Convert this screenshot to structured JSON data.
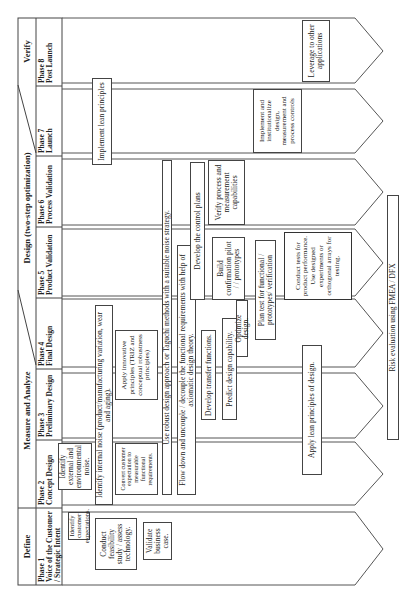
{
  "header": {
    "stages": [
      {
        "id": "define",
        "label": "Define"
      },
      {
        "id": "measure",
        "label": "Measure and Analyze"
      },
      {
        "id": "design",
        "label": "Design (two-step optimization)"
      },
      {
        "id": "verify",
        "label": "Verify"
      }
    ]
  },
  "phases": [
    {
      "number": "Phase 1",
      "name": "Voice of the Customer / Strategic Intent"
    },
    {
      "number": "Phase 2",
      "name": "Concept Design"
    },
    {
      "number": "Phase 3",
      "name": "Preliminary Design"
    },
    {
      "number": "Phase 4",
      "name": "Final Design"
    },
    {
      "number": "Phase 5",
      "name": "Product Validation"
    },
    {
      "number": "Phase 6",
      "name": "Process Validation"
    },
    {
      "number": "Phase 7",
      "name": "Launch"
    },
    {
      "number": "Phase 8",
      "name": "Post Launch"
    }
  ],
  "activities": {
    "identify_customer_expectations": "Identify customer expectations.",
    "conduct_feasibility": "Conduct feasibility study / assess technology.",
    "validate_business_case": "Validate business case.",
    "identify_external_noise": "Identify external and environmental noise.",
    "identify_internal_noise": "Identify internal noise (product/manufacturing variation, wear and aging).",
    "convert_customer_expectation": "Convert customer expectation to measurable functional requirements.",
    "apply_innovative_principles": "Apply innovative principles (TRIZ and conceptual robustness principles)",
    "robust_design": "Use robust design approach or Taguchi methods with a suitable noise strategy.",
    "flow_down": "Flow down and uncouple / decouple the functional requirements with help of axiomatic design theory.",
    "develop_transfer_functions": "Develop transfer functions.",
    "predict_design_capability": "Predict design capability.",
    "optimize_design": "Optimize design.",
    "develop_control_plans": "Develop the control plans",
    "build_confirmation": "Build confirmation pilot / / prototypes",
    "plan_test": "Plan test for functional / prototypes/ verification",
    "conduct_tests": "Conduct tests for product performance. Use designed experiments or orthogonal arrays for testing.",
    "verify_process": "Verify process and measurement capabilities",
    "implement_lean": "Implement lean principles",
    "implement_institutionalize": "Implement and institutionalize design, measurement and process controls",
    "leverage": "Leverage to other applications",
    "apply_lean_design": "Apply lean principles of design.",
    "risk_evaluation": "Risk evaluation using FMEA / DFX"
  }
}
